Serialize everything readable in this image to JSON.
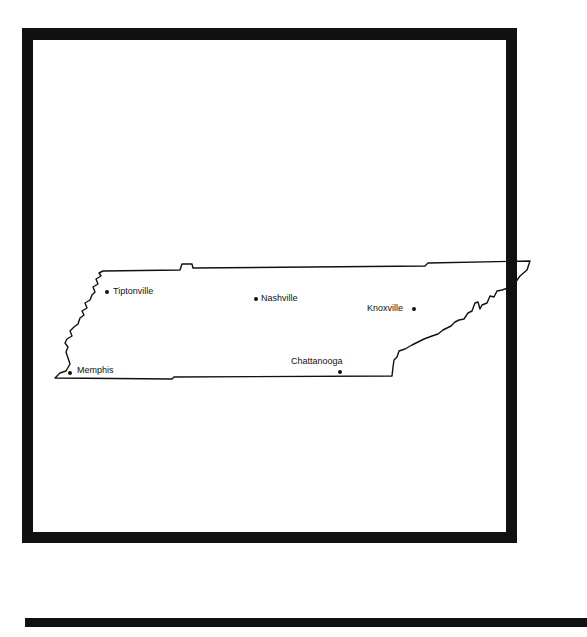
{
  "map": {
    "region": "Tennessee",
    "cities": [
      {
        "name": "Tiptonville"
      },
      {
        "name": "Nashville"
      },
      {
        "name": "Knoxville"
      },
      {
        "name": "Memphis"
      },
      {
        "name": "Chattanooga"
      }
    ]
  },
  "colors": {
    "ink": "#111111",
    "paper": "#ffffff"
  }
}
